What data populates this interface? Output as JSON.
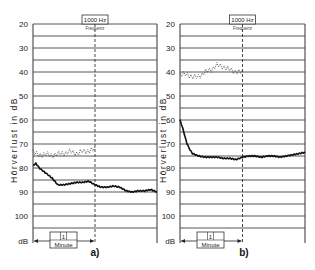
{
  "chart_data": [
    {
      "type": "line",
      "panel_label": "a)",
      "title": "1000 Hz",
      "subtitle": "Frequenz",
      "xlabel": "1 Minute",
      "ylabel": "Hörverlust in dB",
      "yunit_label": "dB",
      "ylim": [
        20,
        105
      ],
      "y_inverted": true,
      "yticks": [
        20,
        30,
        40,
        50,
        60,
        70,
        80,
        90,
        100
      ],
      "grid": true,
      "grid_step": 5,
      "x_range_minutes": [
        0,
        2
      ],
      "vertical_marker_minute": 1,
      "series": [
        {
          "name": "dotted (tracking, test 1)",
          "style": "dotted-zigzag",
          "x": [
            0,
            0.1,
            0.2,
            0.3,
            0.4,
            0.5,
            0.6,
            0.7,
            0.8,
            0.9,
            1.0
          ],
          "values": [
            73,
            75,
            74,
            75,
            74,
            74,
            73,
            74,
            73,
            73,
            72
          ]
        },
        {
          "name": "solid (tracking, test 2)",
          "style": "solid",
          "x": [
            0,
            0.05,
            0.1,
            0.2,
            0.3,
            0.4,
            0.5,
            0.6,
            0.7,
            0.8,
            0.9,
            1.0,
            1.1,
            1.2,
            1.3,
            1.4,
            1.5,
            1.6,
            1.7,
            1.8,
            1.9,
            2.0
          ],
          "values": [
            79,
            78,
            80,
            82,
            84,
            87,
            87,
            86.5,
            86,
            86,
            85.5,
            87,
            88,
            88,
            87.5,
            88,
            89.5,
            90,
            89.5,
            89.5,
            89,
            90
          ]
        }
      ]
    },
    {
      "type": "line",
      "panel_label": "b)",
      "title": "1000 Hz",
      "subtitle": "Frequenz",
      "xlabel": "1 Minute",
      "ylabel": "Hörverlust in dB",
      "yunit_label": "dB",
      "ylim": [
        20,
        105
      ],
      "y_inverted": true,
      "yticks": [
        20,
        30,
        40,
        50,
        60,
        70,
        80,
        90,
        100
      ],
      "grid": true,
      "grid_step": 5,
      "x_range_minutes": [
        0,
        2
      ],
      "vertical_marker_minute": 1,
      "series": [
        {
          "name": "dotted (tracking, test 1)",
          "style": "dotted-zigzag",
          "x": [
            0,
            0.1,
            0.2,
            0.3,
            0.4,
            0.5,
            0.6,
            0.7,
            0.8,
            0.9,
            1.0
          ],
          "values": [
            41,
            41,
            42,
            42,
            40,
            39,
            37,
            38,
            39,
            40,
            40
          ]
        },
        {
          "name": "solid (tracking, test 2)",
          "style": "solid",
          "x": [
            0,
            0.05,
            0.1,
            0.15,
            0.2,
            0.3,
            0.4,
            0.5,
            0.6,
            0.7,
            0.8,
            0.9,
            1.0,
            1.1,
            1.2,
            1.3,
            1.4,
            1.5,
            1.6,
            1.7,
            1.8,
            1.9,
            2.0
          ],
          "values": [
            60,
            64,
            69,
            72,
            74,
            75,
            75.5,
            75.5,
            75.5,
            76,
            76,
            76.5,
            75.5,
            75,
            75,
            75.5,
            75,
            75,
            75.5,
            75,
            74.5,
            74,
            73.5
          ]
        }
      ]
    }
  ],
  "labels": {
    "panel_a": "a)",
    "panel_b": "b)",
    "freq": "1000 Hz",
    "freq_sub": "Frequenz",
    "ylabel": "Hörverlust in dB",
    "db": "dB",
    "minute_num": "1",
    "minute": "Minute"
  }
}
